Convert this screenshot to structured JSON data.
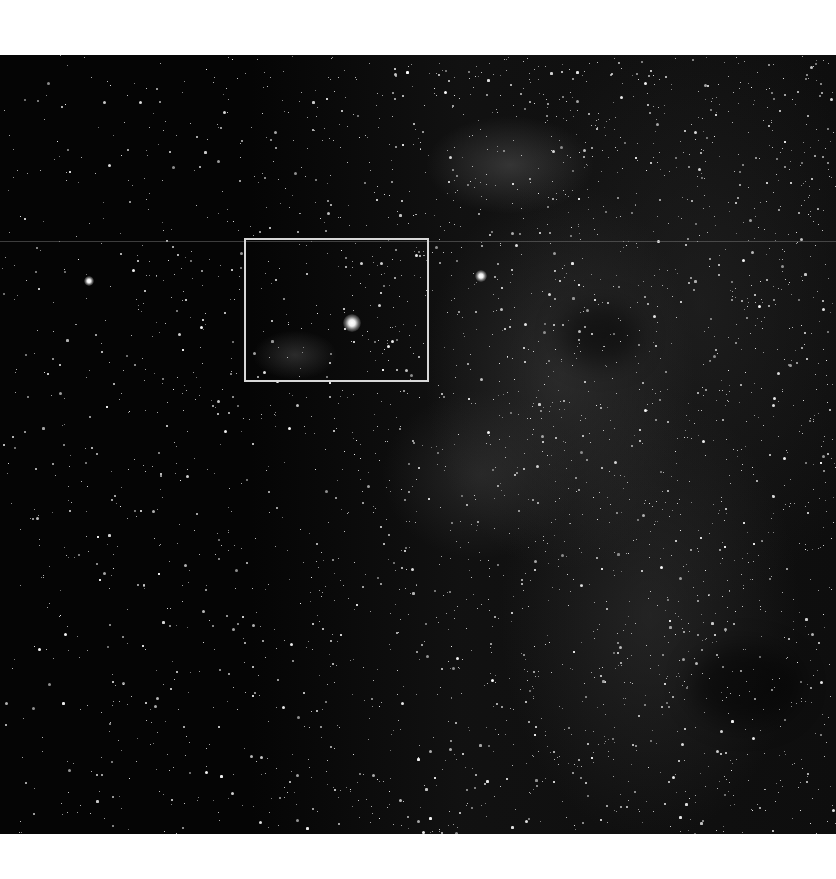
{
  "image": {
    "description": "Grayscale wide-field astronomical photograph of a dense Milky Way star field with faint nebulosity, with a white rectangle marking a region of interest",
    "background_color": "#ffffff",
    "photo_color": "#050505"
  },
  "annotation": {
    "type": "rectangle",
    "color": "#d8d8d8",
    "x": 244,
    "y": 238,
    "width": 184,
    "height": 143
  },
  "features": {
    "bright_stars": [
      {
        "name": "bright-star-in-box",
        "x": 406,
        "y": 323
      },
      {
        "name": "bright-star-right",
        "x": 482,
        "y": 277
      },
      {
        "name": "bright-star-left",
        "x": 90,
        "y": 282
      }
    ],
    "nebulae": [
      {
        "name": "nebula-upper",
        "x": 510,
        "y": 165
      },
      {
        "name": "nebula-in-box",
        "x": 295,
        "y": 355
      }
    ]
  }
}
